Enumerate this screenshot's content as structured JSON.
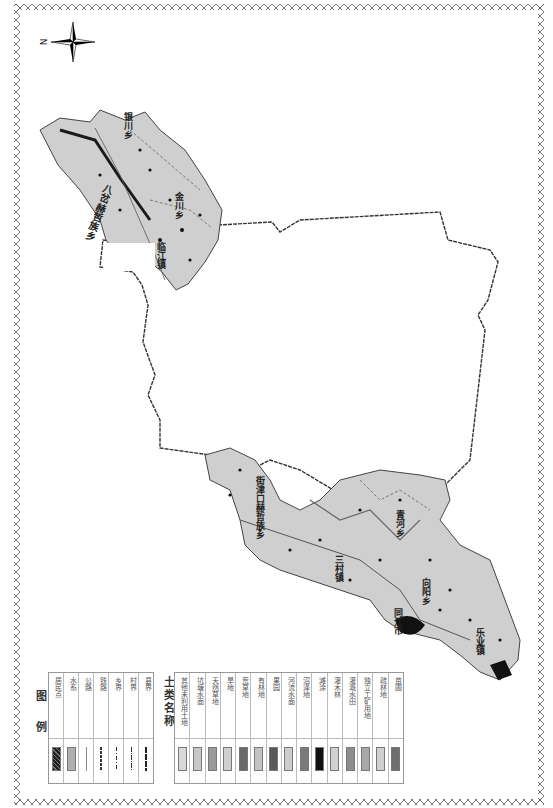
{
  "compass": {
    "north_label": "N"
  },
  "legend_symbols": {
    "title": "图 例",
    "items": [
      {
        "label": "居民点",
        "symbol": "crosshatch-fill",
        "color": "#333333"
      },
      {
        "label": "水系",
        "symbol": "fill",
        "color": "#b0b0b0"
      },
      {
        "label": "公路",
        "symbol": "line-solid",
        "color": "#888888"
      },
      {
        "label": "铁路",
        "symbol": "line-dashed-bold",
        "color": "#444444"
      },
      {
        "label": "乡界",
        "symbol": "line-dash-dot",
        "color": "#444444"
      },
      {
        "label": "村界",
        "symbol": "line-dash-dot-dot",
        "color": "#444444"
      },
      {
        "label": "县界",
        "symbol": "line-bold",
        "color": "#333333"
      }
    ]
  },
  "legend_landuse": {
    "title": "土类名称",
    "items": [
      {
        "label": "其他未利用土地",
        "color": "#d8d8d8"
      },
      {
        "label": "坑塘水面",
        "color": "#c8c8c8"
      },
      {
        "label": "天然草地",
        "color": "#9a9a9a"
      },
      {
        "label": "旱地",
        "color": "#cfcfcf"
      },
      {
        "label": "荒草地",
        "color": "#6a6a6a"
      },
      {
        "label": "有林地",
        "color": "#c4c4c4"
      },
      {
        "label": "果园",
        "color": "#5a5a5a"
      },
      {
        "label": "河流水面",
        "color": "#cdcdcd"
      },
      {
        "label": "沼泽地",
        "color": "#7a7a7a"
      },
      {
        "label": "滩涂",
        "color": "#111111"
      },
      {
        "label": "灌木林",
        "color": "#d2d2d2"
      },
      {
        "label": "灌溉水田",
        "color": "#8e8e8e"
      },
      {
        "label": "独立工矿用地",
        "color": "#a8a8a8"
      },
      {
        "label": "疏林地",
        "color": "#d0d0d0"
      },
      {
        "label": "苗圃",
        "color": "#6e6e6e"
      }
    ]
  },
  "map_labels": {
    "bacha": "八岔赫哲族乡",
    "yinchuan": "银川乡",
    "jinchuan": "金川乡",
    "linjiang": "临江镇",
    "jiejinkou": "街津口赫哲族乡",
    "sancun": "三村镇",
    "qinghe": "青河乡",
    "xiangyang": "向阳乡",
    "tongjiang": "同江市",
    "leye": "乐业镇"
  }
}
